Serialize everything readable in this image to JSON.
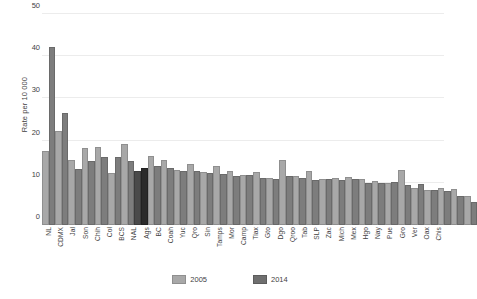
{
  "chart_data": {
    "type": "bar",
    "title": "",
    "xlabel": "",
    "ylabel": "Rate per 10 000",
    "ylim": [
      0,
      50
    ],
    "yticks": [
      0,
      10,
      20,
      30,
      40,
      50
    ],
    "grid": true,
    "legend_position": "bottom",
    "highlight_category": "NAL",
    "categories": [
      "NL",
      "CDMX",
      "Jal",
      "Son",
      "Chih",
      "Col",
      "BCS",
      "NAL",
      "Ags",
      "BC",
      "Coah",
      "Yuc",
      "Qro",
      "Sin",
      "Tamps",
      "Mor",
      "Camp",
      "Tlax",
      "Gto",
      "Dgo",
      "Qroo",
      "Tab",
      "SLP",
      "Zac",
      "Mich",
      "Mex",
      "Hgo",
      "Nay",
      "Pue",
      "Gro",
      "Ver",
      "Oax",
      "Chis"
    ],
    "series": [
      {
        "name": "2005",
        "color": "#a8a8a8",
        "values": [
          17.0,
          21.7,
          15.0,
          17.8,
          17.9,
          11.8,
          18.8,
          12.4,
          15.8,
          15.0,
          12.6,
          13.9,
          12.1,
          13.6,
          12.3,
          11.4,
          12.2,
          10.6,
          15.0,
          11.1,
          12.4,
          10.4,
          10.6,
          11.0,
          10.5,
          10.0,
          9.6,
          12.6,
          8.4,
          7.8,
          8.3,
          8.1,
          6.4
        ]
      },
      {
        "name": "2014",
        "color": "#7d7d7d",
        "values": [
          41.8,
          26.0,
          12.9,
          14.6,
          15.7,
          15.6,
          14.8,
          13.0,
          13.5,
          13.1,
          12.4,
          12.3,
          11.8,
          11.6,
          11.1,
          11.3,
          10.6,
          10.5,
          11.2,
          10.6,
          10.3,
          10.4,
          10.3,
          10.4,
          9.6,
          9.5,
          9.7,
          8.9,
          9.2,
          7.8,
          7.7,
          6.5,
          4.9
        ]
      }
    ],
    "legend": [
      "2005",
      "2014"
    ]
  }
}
